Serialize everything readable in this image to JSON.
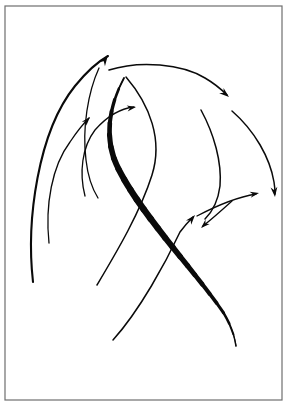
{
  "figure": {
    "background_color": "#ffffff",
    "canvas": {
      "width": 290,
      "height": 413
    },
    "frame": {
      "name": "image-border",
      "x": 5,
      "y": 6,
      "width": 277,
      "height": 394,
      "stroke_color": "#6e6e6e",
      "stroke_width": 1.2,
      "fill_color": "#ffffff"
    },
    "ink_color": "#0a0a0a",
    "stroke_count": 11,
    "arrowhead_count": 7
  },
  "chart_data": {
    "type": "scatter",
    "xlabel": "",
    "ylabel": "",
    "xlim": [
      0,
      290
    ],
    "ylim": [
      0,
      413
    ],
    "grid": false,
    "legend": "none",
    "annotations": [
      "Bundle of sweeping arcs rising from lower-left toward upper-right",
      "One heavy tapered S-stroke crossing the composition diagonally",
      "Cluster of three small arrowheads converging at mid-right"
    ],
    "strokes": [
      {
        "id": "arc-left-outer",
        "label": "outer left sweeping arrow",
        "weight": "medium",
        "stroke_width": 2.1,
        "has_arrowhead": true,
        "arrow_at": "end",
        "path": "M 33 282 C 26 220, 38 132, 75 86 C 88 70, 99 61, 108 56",
        "points": [
          [
            33,
            282
          ],
          [
            40,
            230
          ],
          [
            52,
            168
          ],
          [
            75,
            108
          ],
          [
            95,
            72
          ],
          [
            108,
            56
          ]
        ]
      },
      {
        "id": "arc-left-mid",
        "label": "middle left rising arrow",
        "weight": "thin",
        "stroke_width": 1.3,
        "has_arrowhead": true,
        "arrow_at": "end",
        "path": "M 49 243 C 45 205, 52 166, 70 142 C 78 130, 84 123, 89 118",
        "points": [
          [
            49,
            243
          ],
          [
            47,
            210
          ],
          [
            56,
            170
          ],
          [
            73,
            138
          ],
          [
            89,
            118
          ]
        ]
      },
      {
        "id": "arc-left-inner",
        "label": "inner left rising arrow",
        "weight": "thin",
        "stroke_width": 1.3,
        "has_arrowhead": true,
        "arrow_at": "end",
        "path": "M 85 196 C 79 173, 82 147, 95 130 C 110 113, 124 108, 134 107",
        "points": [
          [
            85,
            196
          ],
          [
            80,
            172
          ],
          [
            90,
            140
          ],
          [
            112,
            113
          ],
          [
            134,
            107
          ]
        ]
      },
      {
        "id": "arc-top-over",
        "label": "top arcing arrow curving right and down",
        "weight": "thin",
        "stroke_width": 1.5,
        "has_arrowhead": true,
        "arrow_at": "end",
        "path": "M 109 70 C 140 60, 182 64, 205 78 C 217 85, 223 91, 227 95",
        "points": [
          [
            109,
            70
          ],
          [
            140,
            62
          ],
          [
            172,
            65
          ],
          [
            205,
            79
          ],
          [
            227,
            95
          ]
        ]
      },
      {
        "id": "curve-inner-s",
        "label": "inner sweeping S curve",
        "weight": "thin",
        "stroke_width": 1.5,
        "has_arrowhead": false,
        "arrow_at": "none",
        "path": "M 126 77 C 150 105, 163 140, 152 175 C 140 213, 116 253, 97 285",
        "points": [
          [
            126,
            77
          ],
          [
            150,
            110
          ],
          [
            160,
            150
          ],
          [
            146,
            196
          ],
          [
            115,
            255
          ],
          [
            97,
            285
          ]
        ]
      },
      {
        "id": "curve-left-tail",
        "label": "left descending tail curve",
        "weight": "thin",
        "stroke_width": 1.3,
        "has_arrowhead": false,
        "arrow_at": "none",
        "path": "M 99 68 C 88 92, 82 128, 86 160 C 88 178, 93 190, 98 198",
        "points": [
          [
            99,
            68
          ],
          [
            88,
            100
          ],
          [
            84,
            140
          ],
          [
            92,
            182
          ],
          [
            98,
            198
          ]
        ]
      },
      {
        "id": "curve-right-outer",
        "label": "right outer descending arrow",
        "weight": "thin",
        "stroke_width": 1.5,
        "has_arrowhead": true,
        "arrow_at": "end",
        "path": "M 232 111 C 255 131, 270 158, 274 182 C 275 188, 275 192, 275 194",
        "points": [
          [
            232,
            111
          ],
          [
            256,
            134
          ],
          [
            269,
            162
          ],
          [
            275,
            194
          ]
        ]
      },
      {
        "id": "curve-right-inner",
        "label": "right inner descending curve",
        "weight": "thin",
        "stroke_width": 1.5,
        "has_arrowhead": false,
        "arrow_at": "none",
        "path": "M 201 110 C 214 134, 222 162, 220 186 C 218 202, 212 212, 205 219",
        "points": [
          [
            201,
            110
          ],
          [
            215,
            140
          ],
          [
            221,
            172
          ],
          [
            212,
            206
          ],
          [
            205,
            219
          ]
        ]
      },
      {
        "id": "arrow-cluster-right",
        "label": "short arrow pointing right in cluster",
        "weight": "thin",
        "stroke_width": 1.3,
        "has_arrowhead": true,
        "arrow_at": "end",
        "path": "M 197 216 C 216 206, 238 197, 256 194",
        "points": [
          [
            197,
            216
          ],
          [
            222,
            203
          ],
          [
            256,
            194
          ]
        ]
      },
      {
        "id": "arrow-cluster-downleft",
        "label": "short arrow pointing down-left in cluster",
        "weight": "thin",
        "stroke_width": 1.3,
        "has_arrowhead": true,
        "arrow_at": "end",
        "path": "M 232 201 C 222 210, 212 219, 203 226",
        "points": [
          [
            232,
            201
          ],
          [
            216,
            215
          ],
          [
            203,
            226
          ]
        ]
      },
      {
        "id": "arrow-cluster-upright",
        "label": "long arrow from lower-left to cluster",
        "weight": "thin",
        "stroke_width": 1.5,
        "has_arrowhead": true,
        "arrow_at": "end",
        "path": "M 113 340 C 140 310, 166 262, 180 232 C 186 224, 190 220, 193 217",
        "points": [
          [
            113,
            340
          ],
          [
            146,
            296
          ],
          [
            172,
            248
          ],
          [
            193,
            217
          ]
        ]
      },
      {
        "id": "thick-s-curve",
        "label": "heavy tapered diagonal S stroke",
        "weight": "thick",
        "stroke_width": 6.5,
        "has_arrowhead": false,
        "arrow_at": "none",
        "path": "M 124 78 C 108 108, 104 140, 118 168 C 142 216, 196 272, 225 315 C 232 328, 235 338, 236 346",
        "points": [
          [
            124,
            78
          ],
          [
            108,
            112
          ],
          [
            110,
            150
          ],
          [
            140,
            202
          ],
          [
            196,
            272
          ],
          [
            226,
            318
          ],
          [
            236,
            346
          ]
        ]
      }
    ],
    "arrowheads": [
      {
        "id": "head-left-outer",
        "x": 108,
        "y": 55,
        "angle": -56,
        "size": 11,
        "label": "upper-left arrowhead"
      },
      {
        "id": "head-left-mid",
        "x": 90,
        "y": 117,
        "angle": -48,
        "size": 9,
        "label": "mid-left arrowhead"
      },
      {
        "id": "head-left-inner",
        "x": 136,
        "y": 107,
        "angle": -10,
        "size": 9,
        "label": "inner-left arrowhead"
      },
      {
        "id": "head-top-over",
        "x": 229,
        "y": 97,
        "angle": 40,
        "size": 10,
        "label": "top arc arrowhead"
      },
      {
        "id": "head-right-outer",
        "x": 275,
        "y": 197,
        "angle": 84,
        "size": 10,
        "label": "right descending arrowhead"
      },
      {
        "id": "head-cluster-right",
        "x": 259,
        "y": 193,
        "angle": -11,
        "size": 9,
        "label": "cluster right arrowhead"
      },
      {
        "id": "head-cluster-downleft",
        "x": 201,
        "y": 228,
        "angle": 137,
        "size": 9,
        "label": "cluster down-left arrowhead"
      },
      {
        "id": "head-cluster-upright",
        "x": 195,
        "y": 215,
        "angle": -50,
        "size": 10,
        "label": "cluster up-right arrowhead"
      }
    ]
  }
}
